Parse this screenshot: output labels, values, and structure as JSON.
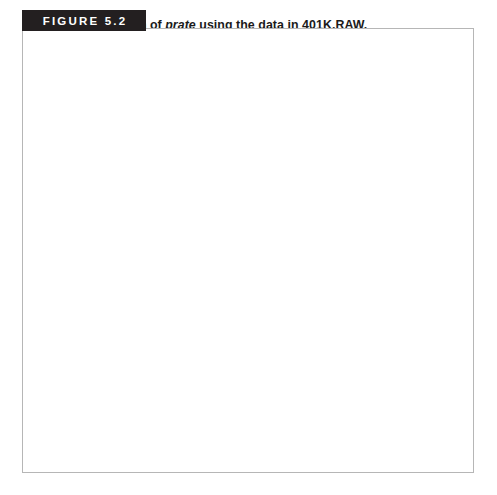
{
  "figure": {
    "tag_label": "FIGURE 5.2",
    "title_prefix": "Histogram of ",
    "title_variable": "prate",
    "title_suffix": " using the data in 401K.RAW.",
    "tag_bg_color": "#231f20",
    "tag_text_color": "#ffffff",
    "border_color": "#b6b6b6"
  },
  "chart_data": {
    "type": "bar",
    "title": "Histogram of prate using the data in 401K.RAW.",
    "xlabel": "participation rate (in percentage form)",
    "ylabel": "proportion in cell",
    "categories": [
      "0-10",
      "10-20",
      "20-30",
      "30-40",
      "40-50",
      "50-60",
      "60-70",
      "70-80",
      "80-90",
      "90-100"
    ],
    "bin_edges": [
      0,
      10,
      20,
      30,
      40,
      50,
      60,
      70,
      80,
      90,
      100
    ],
    "values": [
      0.001,
      0.002,
      0.008,
      0.01,
      0.014,
      0.031,
      0.047,
      0.091,
      0.101,
      0.587
    ],
    "xlim": [
      0,
      100
    ],
    "ylim": [
      0,
      0.88
    ],
    "xticks": [
      0,
      10,
      20,
      30,
      40,
      50,
      60,
      70,
      80,
      90,
      100
    ],
    "xtick_labels": [
      "0",
      "10",
      "20",
      "30",
      "40",
      "50",
      "60",
      "70",
      "80",
      "90",
      "100"
    ],
    "yticks": [
      0,
      0.2,
      0.4,
      0.6,
      0.8
    ],
    "ytick_labels": [
      "0",
      ".2",
      ".4",
      ".6",
      ".8"
    ],
    "grid": false,
    "legend": null,
    "bar_fill_color": "#e2e2e2",
    "bar_edge_color": "#6d6e70",
    "axis_color": "#58595b"
  }
}
